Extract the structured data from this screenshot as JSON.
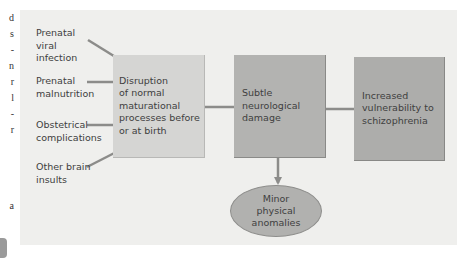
{
  "edge_fragments": [
    "d",
    "s",
    "-",
    "n",
    "r",
    "l",
    "-",
    "r",
    "",
    "",
    "",
    "",
    "",
    "",
    "",
    "",
    "",
    "",
    "",
    "",
    "",
    "",
    "",
    "a"
  ],
  "inputs": [
    {
      "lines": [
        "Prenatal",
        "viral",
        "infection"
      ]
    },
    {
      "lines": [
        "Prenatal",
        "malnutrition"
      ]
    },
    {
      "lines": [
        "Obstetrical",
        "complications"
      ]
    },
    {
      "lines": [
        "Other brain",
        "insults"
      ]
    }
  ],
  "boxes": {
    "disruption": {
      "lines": [
        "Disruption",
        "of normal",
        "maturational",
        "processes before",
        "or at birth"
      ]
    },
    "neuro_damage": {
      "lines": [
        "Subtle",
        "neurological",
        "damage"
      ]
    },
    "vulnerability": {
      "lines": [
        "Increased",
        "vulnerability to",
        "schizophrenia"
      ]
    }
  },
  "outcome": {
    "lines": [
      "Minor",
      "physical",
      "anomalies"
    ]
  },
  "colors": {
    "panel": "#efefed",
    "box_light": "#d5d5d3",
    "box_medium": "#b3b3b1",
    "arrow": "#8c8c8a"
  }
}
